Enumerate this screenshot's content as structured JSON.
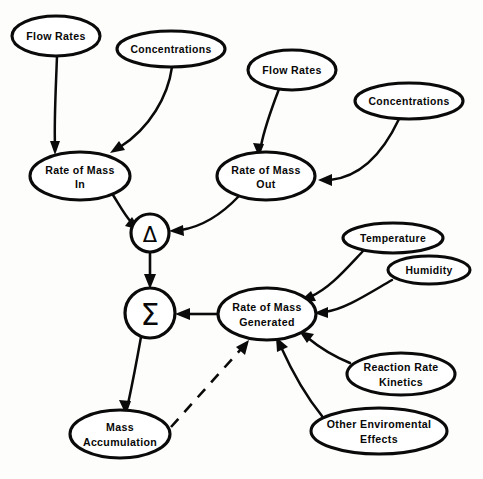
{
  "diagram": {
    "background_color": "#fdfdfb",
    "stroke_color": "#0a0a0a",
    "text_color": "#080808",
    "nodes": [
      {
        "id": "flow_rates_in",
        "label_line1": "Flow Rates",
        "label_line2": "",
        "shape": "ellipse",
        "cx": 56,
        "cy": 36,
        "rx": 44,
        "ry": 20
      },
      {
        "id": "concentrations_in",
        "label_line1": "Concentrations",
        "label_line2": "",
        "shape": "ellipse",
        "cx": 171,
        "cy": 49,
        "rx": 54,
        "ry": 18
      },
      {
        "id": "flow_rates_out",
        "label_line1": "Flow Rates",
        "label_line2": "",
        "shape": "ellipse",
        "cx": 292,
        "cy": 70,
        "rx": 44,
        "ry": 20
      },
      {
        "id": "concentrations_out",
        "label_line1": "Concentrations",
        "label_line2": "",
        "shape": "ellipse",
        "cx": 409,
        "cy": 101,
        "rx": 54,
        "ry": 18
      },
      {
        "id": "rate_mass_in",
        "label_line1": "Rate of Mass",
        "label_line2": "In",
        "shape": "ellipse",
        "cx": 80,
        "cy": 176,
        "rx": 50,
        "ry": 24
      },
      {
        "id": "rate_mass_out",
        "label_line1": "Rate of Mass",
        "label_line2": "Out",
        "shape": "ellipse",
        "cx": 266,
        "cy": 176,
        "rx": 49,
        "ry": 24
      },
      {
        "id": "delta_node",
        "label_line1": "Δ",
        "label_line2": "",
        "shape": "circle",
        "cx": 150,
        "cy": 233,
        "rx": 19,
        "ry": 19
      },
      {
        "id": "sigma_node",
        "label_line1": "Σ",
        "label_line2": "",
        "shape": "circle",
        "cx": 150,
        "cy": 313,
        "rx": 25,
        "ry": 25
      },
      {
        "id": "temperature",
        "label_line1": "Temperature",
        "label_line2": "",
        "shape": "ellipse",
        "cx": 393,
        "cy": 238,
        "rx": 50,
        "ry": 15
      },
      {
        "id": "humidity",
        "label_line1": "Humidity",
        "label_line2": "",
        "shape": "ellipse",
        "cx": 429,
        "cy": 270,
        "rx": 41,
        "ry": 14
      },
      {
        "id": "rate_mass_generated",
        "label_line1": "Rate of Mass",
        "label_line2": "Generated",
        "shape": "ellipse",
        "cx": 267,
        "cy": 314,
        "rx": 49,
        "ry": 26
      },
      {
        "id": "reaction_rate_kinetics",
        "label_line1": "Reaction  Rate",
        "label_line2": "Kinetics",
        "shape": "ellipse",
        "cx": 401,
        "cy": 374,
        "rx": 54,
        "ry": 21
      },
      {
        "id": "other_enviromental_effects",
        "label_line1": "Other Enviromental",
        "label_line2": "Effects",
        "shape": "ellipse",
        "cx": 379,
        "cy": 431,
        "rx": 68,
        "ry": 23
      },
      {
        "id": "mass_accumulation",
        "label_line1": "Mass",
        "label_line2": "Accumulation",
        "shape": "ellipse",
        "cx": 120,
        "cy": 434,
        "rx": 50,
        "ry": 24
      }
    ],
    "edges": [
      {
        "id": "e_flowin_ratein",
        "from": "flow_rates_in",
        "to": "rate_mass_in",
        "style": "solid",
        "arrow": true
      },
      {
        "id": "e_concin_ratein",
        "from": "concentrations_in",
        "to": "rate_mass_in",
        "style": "solid",
        "arrow": true
      },
      {
        "id": "e_flowout_rateout",
        "from": "flow_rates_out",
        "to": "rate_mass_out",
        "style": "solid",
        "arrow": true
      },
      {
        "id": "e_concout_rateout",
        "from": "concentrations_out",
        "to": "rate_mass_out",
        "style": "solid",
        "arrow": true
      },
      {
        "id": "e_ratein_delta",
        "from": "rate_mass_in",
        "to": "delta_node",
        "style": "solid",
        "arrow": true
      },
      {
        "id": "e_rateout_delta",
        "from": "rate_mass_out",
        "to": "delta_node",
        "style": "solid",
        "arrow": true
      },
      {
        "id": "e_delta_sigma",
        "from": "delta_node",
        "to": "sigma_node",
        "style": "solid",
        "arrow": true
      },
      {
        "id": "e_generated_sigma",
        "from": "rate_mass_generated",
        "to": "sigma_node",
        "style": "solid",
        "arrow": true
      },
      {
        "id": "e_temp_generated",
        "from": "temperature",
        "to": "rate_mass_generated",
        "style": "solid",
        "arrow": true
      },
      {
        "id": "e_humidity_generated",
        "from": "humidity",
        "to": "rate_mass_generated",
        "style": "solid",
        "arrow": true
      },
      {
        "id": "e_kinetics_generated",
        "from": "reaction_rate_kinetics",
        "to": "rate_mass_generated",
        "style": "solid",
        "arrow": true
      },
      {
        "id": "e_enviro_generated",
        "from": "other_enviromental_effects",
        "to": "rate_mass_generated",
        "style": "solid",
        "arrow": true
      },
      {
        "id": "e_sigma_accumulation",
        "from": "sigma_node",
        "to": "mass_accumulation",
        "style": "solid",
        "arrow": true
      },
      {
        "id": "e_accumulation_generated",
        "from": "mass_accumulation",
        "to": "rate_mass_generated",
        "style": "dashed",
        "arrow": true
      }
    ]
  }
}
